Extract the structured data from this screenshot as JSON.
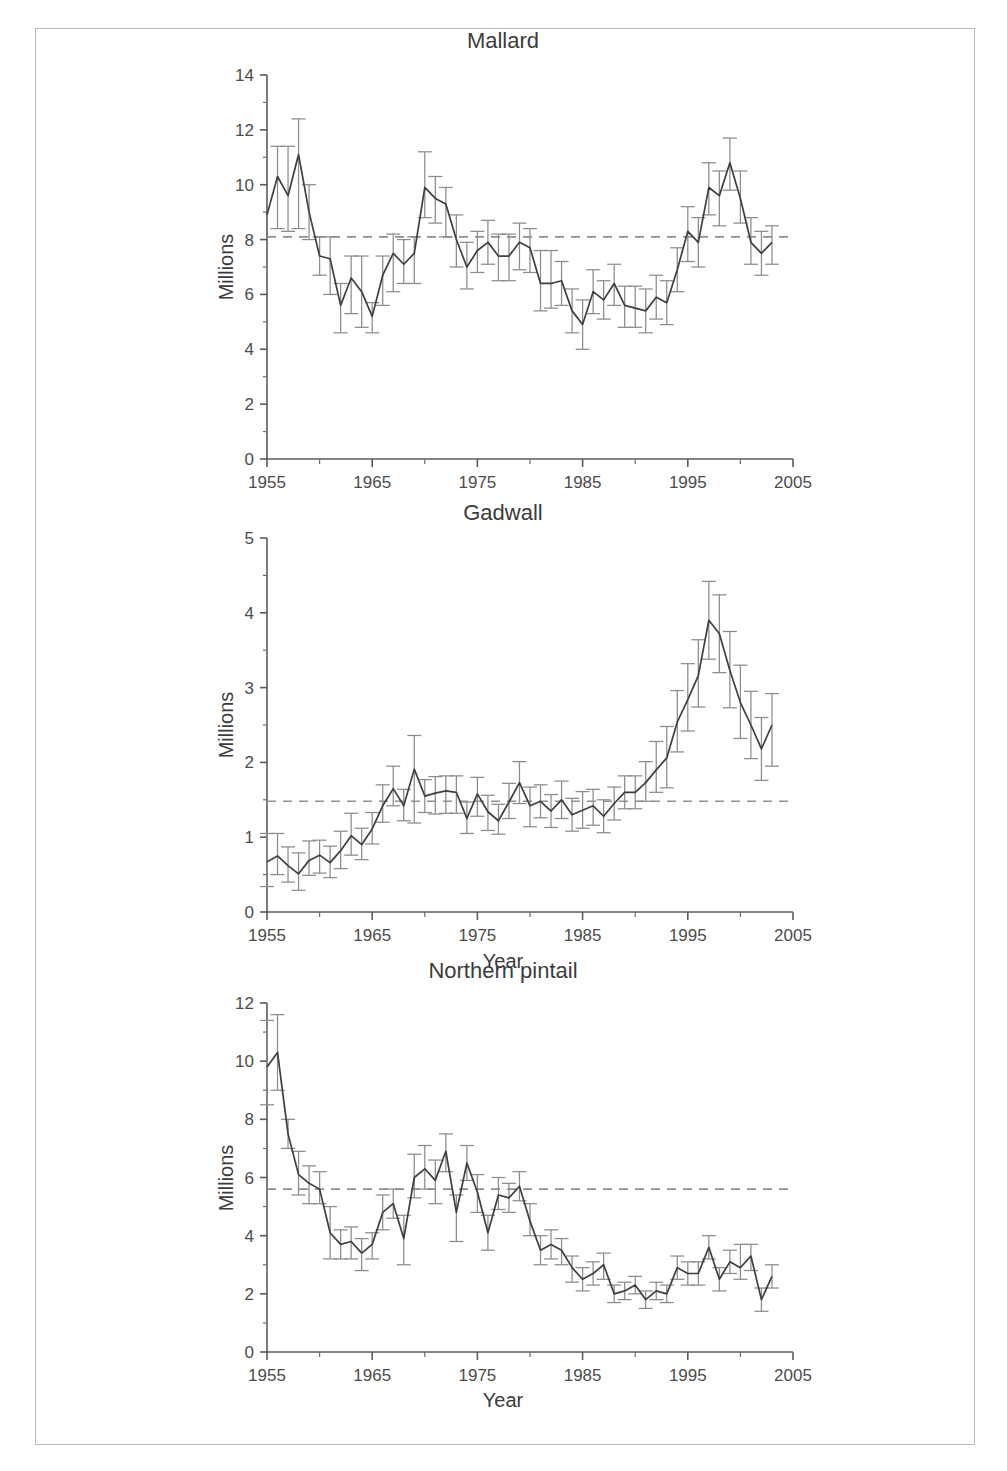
{
  "figure": {
    "background_color": "#ffffff",
    "border_color": "#b9b9b9",
    "line_color": "#3f3f3f",
    "errorbar_color": "#8c8c8c",
    "refline_color": "#8f8f8f",
    "axis_color": "#5b5b5b"
  },
  "panels": [
    {
      "key": "mallard",
      "title": "Mallard",
      "ylabel": "Millions",
      "xlabel": "",
      "show_xlabel": false
    },
    {
      "key": "gadwall",
      "title": "Gadwall",
      "ylabel": "Millions",
      "xlabel": "Year",
      "show_xlabel": true
    },
    {
      "key": "pintail",
      "title": "Northern pintail",
      "ylabel": "Millions",
      "xlabel": "Year",
      "show_xlabel": true
    }
  ],
  "chart_data": [
    {
      "type": "line",
      "key": "mallard",
      "title": "Mallard",
      "xlabel": "",
      "ylabel": "Millions",
      "xlim": [
        1955,
        2005
      ],
      "ylim": [
        0,
        14
      ],
      "xticks": [
        1955,
        1965,
        1975,
        1985,
        1995,
        2005
      ],
      "xtick_labels": [
        "1955",
        "1965",
        "1975",
        "1985",
        "1995",
        "2005"
      ],
      "yticks": [
        0,
        2,
        4,
        6,
        8,
        10,
        12,
        14
      ],
      "ytick_labels": [
        "0",
        "2",
        "4",
        "6",
        "8",
        "10",
        "12",
        "14"
      ],
      "minor_xticks_per_interval": 2,
      "minor_yticks_per_interval": 2,
      "grid": false,
      "legend": null,
      "reference_line": {
        "value": 8.1,
        "style": "dashed",
        "label": "long-term average"
      },
      "errorbars": true,
      "x": [
        1955,
        1956,
        1957,
        1958,
        1959,
        1960,
        1961,
        1962,
        1963,
        1964,
        1965,
        1966,
        1967,
        1968,
        1969,
        1970,
        1971,
        1972,
        1973,
        1974,
        1975,
        1976,
        1977,
        1978,
        1979,
        1980,
        1981,
        1982,
        1983,
        1984,
        1985,
        1986,
        1987,
        1988,
        1989,
        1990,
        1991,
        1992,
        1993,
        1994,
        1995,
        1996,
        1997,
        1998,
        1999,
        2000,
        2001,
        2002,
        2003
      ],
      "values": [
        8.9,
        10.3,
        9.6,
        11.1,
        9.0,
        7.4,
        7.3,
        5.6,
        6.6,
        6.1,
        5.2,
        6.7,
        7.5,
        7.1,
        7.5,
        9.9,
        9.5,
        9.3,
        8.0,
        7.0,
        7.6,
        7.9,
        7.4,
        7.4,
        7.9,
        7.7,
        6.4,
        6.4,
        6.5,
        5.4,
        4.9,
        6.1,
        5.8,
        6.4,
        5.6,
        5.5,
        5.4,
        5.9,
        5.7,
        6.9,
        8.3,
        7.9,
        9.9,
        9.6,
        10.8,
        9.5,
        7.9,
        7.5,
        7.9
      ],
      "err_lower": [
        0.0,
        1.9,
        1.3,
        2.7,
        1.0,
        0.7,
        1.3,
        1.0,
        1.3,
        1.3,
        0.6,
        1.1,
        1.4,
        0.7,
        1.1,
        1.1,
        0.9,
        1.2,
        1.0,
        0.8,
        0.8,
        0.8,
        0.9,
        0.9,
        1.0,
        0.9,
        1.0,
        0.9,
        0.9,
        0.8,
        0.9,
        0.8,
        0.7,
        0.8,
        0.8,
        0.7,
        0.8,
        0.8,
        0.8,
        0.8,
        1.1,
        0.9,
        1.0,
        1.1,
        1.0,
        0.9,
        0.8,
        0.8,
        0.8
      ],
      "err_upper": [
        0.0,
        1.1,
        1.8,
        1.3,
        1.0,
        0.7,
        0.8,
        0.8,
        0.8,
        1.3,
        0.5,
        0.7,
        0.7,
        0.9,
        0.6,
        1.3,
        0.8,
        0.6,
        0.9,
        0.9,
        0.7,
        0.8,
        0.8,
        0.8,
        0.7,
        0.7,
        1.2,
        1.2,
        0.7,
        0.8,
        0.9,
        0.8,
        0.7,
        0.7,
        0.7,
        0.8,
        0.8,
        0.8,
        0.8,
        0.8,
        0.9,
        0.9,
        0.9,
        0.9,
        0.9,
        1.0,
        0.9,
        0.8,
        0.6
      ]
    },
    {
      "type": "line",
      "key": "gadwall",
      "title": "Gadwall",
      "xlabel": "Year",
      "ylabel": "Millions",
      "xlim": [
        1955,
        2005
      ],
      "ylim": [
        0,
        5
      ],
      "xticks": [
        1955,
        1965,
        1975,
        1985,
        1995,
        2005
      ],
      "xtick_labels": [
        "1955",
        "1965",
        "1975",
        "1985",
        "1995",
        "2005"
      ],
      "yticks": [
        0,
        1,
        2,
        3,
        4,
        5
      ],
      "ytick_labels": [
        "0",
        "1",
        "2",
        "3",
        "4",
        "5"
      ],
      "minor_xticks_per_interval": 2,
      "minor_yticks_per_interval": 2,
      "grid": false,
      "legend": null,
      "reference_line": {
        "value": 1.48,
        "style": "dashed",
        "label": "long-term average"
      },
      "errorbars": true,
      "x": [
        1955,
        1956,
        1957,
        1958,
        1959,
        1960,
        1961,
        1962,
        1963,
        1964,
        1965,
        1966,
        1967,
        1968,
        1969,
        1970,
        1971,
        1972,
        1973,
        1974,
        1975,
        1976,
        1977,
        1978,
        1979,
        1980,
        1981,
        1982,
        1983,
        1984,
        1985,
        1986,
        1987,
        1988,
        1989,
        1990,
        1991,
        1992,
        1993,
        1994,
        1995,
        1996,
        1997,
        1998,
        1999,
        2000,
        2001,
        2002,
        2003
      ],
      "values": [
        0.67,
        0.75,
        0.62,
        0.51,
        0.69,
        0.76,
        0.66,
        0.82,
        1.02,
        0.9,
        1.11,
        1.42,
        1.65,
        1.42,
        1.91,
        1.55,
        1.59,
        1.62,
        1.6,
        1.25,
        1.58,
        1.34,
        1.22,
        1.47,
        1.73,
        1.42,
        1.48,
        1.35,
        1.5,
        1.3,
        1.36,
        1.42,
        1.28,
        1.45,
        1.6,
        1.6,
        1.73,
        1.9,
        2.06,
        2.54,
        2.84,
        3.16,
        3.9,
        3.72,
        3.23,
        2.8,
        2.5,
        2.18,
        2.5
      ],
      "err_lower": [
        0.33,
        0.25,
        0.22,
        0.22,
        0.2,
        0.24,
        0.2,
        0.24,
        0.26,
        0.2,
        0.2,
        0.22,
        0.23,
        0.2,
        0.72,
        0.22,
        0.28,
        0.3,
        0.28,
        0.2,
        0.3,
        0.25,
        0.18,
        0.22,
        0.28,
        0.28,
        0.22,
        0.22,
        0.25,
        0.22,
        0.24,
        0.26,
        0.22,
        0.22,
        0.22,
        0.22,
        0.25,
        0.3,
        0.4,
        0.4,
        0.42,
        0.42,
        0.52,
        0.52,
        0.5,
        0.48,
        0.45,
        0.42,
        0.55
      ],
      "err_upper": [
        0.38,
        0.3,
        0.25,
        0.28,
        0.26,
        0.2,
        0.22,
        0.26,
        0.3,
        0.22,
        0.22,
        0.28,
        0.3,
        0.22,
        0.45,
        0.22,
        0.22,
        0.2,
        0.22,
        0.22,
        0.22,
        0.22,
        0.22,
        0.25,
        0.28,
        0.25,
        0.22,
        0.22,
        0.25,
        0.22,
        0.25,
        0.22,
        0.22,
        0.22,
        0.22,
        0.22,
        0.28,
        0.38,
        0.42,
        0.42,
        0.48,
        0.48,
        0.52,
        0.52,
        0.52,
        0.5,
        0.45,
        0.42,
        0.42
      ]
    },
    {
      "type": "line",
      "key": "pintail",
      "title": "Northern pintail",
      "xlabel": "Year",
      "ylabel": "Millions",
      "xlim": [
        1955,
        2005
      ],
      "ylim": [
        0,
        12
      ],
      "xticks": [
        1955,
        1965,
        1975,
        1985,
        1995,
        2005
      ],
      "xtick_labels": [
        "1955",
        "1965",
        "1975",
        "1985",
        "1995",
        "2005"
      ],
      "yticks": [
        0,
        2,
        4,
        6,
        8,
        10,
        12
      ],
      "ytick_labels": [
        "0",
        "2",
        "4",
        "6",
        "8",
        "10",
        "12"
      ],
      "minor_xticks_per_interval": 2,
      "minor_yticks_per_interval": 2,
      "grid": false,
      "legend": null,
      "reference_line": {
        "value": 5.6,
        "style": "dashed",
        "label": "long-term average"
      },
      "errorbars": true,
      "x": [
        1955,
        1956,
        1957,
        1958,
        1959,
        1960,
        1961,
        1962,
        1963,
        1964,
        1965,
        1966,
        1967,
        1968,
        1969,
        1970,
        1971,
        1972,
        1973,
        1974,
        1975,
        1976,
        1977,
        1978,
        1979,
        1980,
        1981,
        1982,
        1983,
        1984,
        1985,
        1986,
        1987,
        1988,
        1989,
        1990,
        1991,
        1992,
        1993,
        1994,
        1995,
        1996,
        1997,
        1998,
        1999,
        2000,
        2001,
        2002,
        2003
      ],
      "values": [
        9.8,
        10.3,
        7.5,
        6.1,
        5.8,
        5.6,
        4.1,
        3.7,
        3.8,
        3.4,
        3.7,
        4.8,
        5.1,
        3.9,
        6.0,
        6.3,
        5.9,
        6.9,
        4.8,
        6.5,
        5.5,
        4.1,
        5.4,
        5.3,
        5.7,
        4.5,
        3.5,
        3.7,
        3.5,
        2.9,
        2.5,
        2.7,
        3.0,
        2.0,
        2.1,
        2.3,
        1.8,
        2.1,
        2.0,
        2.9,
        2.7,
        2.7,
        3.6,
        2.5,
        3.1,
        2.9,
        3.3,
        1.8,
        2.6
      ],
      "err_lower": [
        1.3,
        1.3,
        0.5,
        0.7,
        0.7,
        0.5,
        0.9,
        0.5,
        0.6,
        0.6,
        0.5,
        0.6,
        0.5,
        0.9,
        0.7,
        0.7,
        0.8,
        0.7,
        1.0,
        0.6,
        0.7,
        0.6,
        0.5,
        0.5,
        0.5,
        0.5,
        0.5,
        0.5,
        0.5,
        0.5,
        0.4,
        0.4,
        0.5,
        0.3,
        0.3,
        0.3,
        0.3,
        0.3,
        0.3,
        0.4,
        0.4,
        0.4,
        0.4,
        0.4,
        0.4,
        0.4,
        0.5,
        0.4,
        0.4
      ],
      "err_upper": [
        1.6,
        1.3,
        0.5,
        0.8,
        0.6,
        0.6,
        0.9,
        0.5,
        0.5,
        0.5,
        0.4,
        0.6,
        0.5,
        0.8,
        0.8,
        0.8,
        0.7,
        0.6,
        0.6,
        0.6,
        0.6,
        0.6,
        0.6,
        0.5,
        0.5,
        0.6,
        0.5,
        0.5,
        0.4,
        0.4,
        0.4,
        0.4,
        0.4,
        0.3,
        0.3,
        0.3,
        0.3,
        0.3,
        0.3,
        0.4,
        0.4,
        0.4,
        0.4,
        0.4,
        0.4,
        0.8,
        0.4,
        0.4,
        0.4
      ]
    }
  ]
}
